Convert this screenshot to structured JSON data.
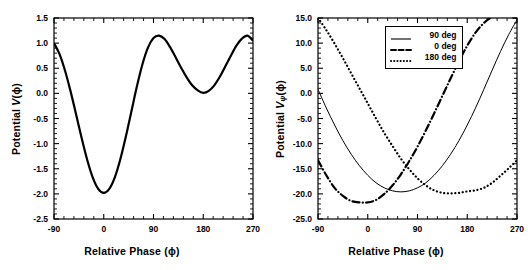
{
  "figure": {
    "background": "#ffffff",
    "ink": "#000000"
  },
  "chart_data": [
    {
      "panel": "left",
      "type": "line",
      "title": "",
      "xlabel": "Relative Phase (ϕ)",
      "ylabel": "Potential V(ϕ)",
      "ylabel_parts": {
        "prefix": "Potential ",
        "symbol": "V",
        "subscript": "",
        "suffix": "(ϕ)"
      },
      "xlim": [
        -90,
        270
      ],
      "ylim": [
        -2.5,
        1.5
      ],
      "xticks": [
        -90,
        0,
        90,
        180,
        270
      ],
      "xticklabels": [
        "-90",
        "0",
        "90",
        "180",
        "270"
      ],
      "yticks": [
        -2.5,
        -2.0,
        -1.5,
        -1.0,
        -0.5,
        0.0,
        0.5,
        1.0,
        1.5
      ],
      "yticklabels": [
        "-2.5",
        "-2.0",
        "-1.5",
        "-1.0",
        "-0.5",
        "0.0",
        "0.5",
        "1.0",
        "1.5"
      ],
      "grid": false,
      "minor_ticks_per_interval": 4,
      "legend": null,
      "series": [
        {
          "name": "V(ϕ)",
          "style": "solid",
          "linewidth": 2.2,
          "color": "#000000",
          "x": [
            -90,
            -80,
            -70,
            -60,
            -50,
            -40,
            -30,
            -20,
            -10,
            0,
            10,
            20,
            30,
            40,
            50,
            60,
            70,
            80,
            90,
            100,
            110,
            120,
            130,
            140,
            150,
            160,
            170,
            180,
            190,
            200,
            210,
            220,
            230,
            240,
            250,
            260,
            270
          ],
          "y": [
            1.0,
            0.78,
            0.45,
            0.04,
            -0.42,
            -0.89,
            -1.32,
            -1.67,
            -1.9,
            -1.98,
            -1.9,
            -1.67,
            -1.31,
            -0.86,
            -0.36,
            0.14,
            0.58,
            0.91,
            1.1,
            1.15,
            1.08,
            0.92,
            0.72,
            0.51,
            0.32,
            0.16,
            0.06,
            0.01,
            0.05,
            0.16,
            0.33,
            0.54,
            0.75,
            0.95,
            1.09,
            1.15,
            1.05
          ]
        }
      ]
    },
    {
      "panel": "right",
      "type": "line",
      "title": "",
      "xlabel": "Relative Phase (ϕ)",
      "ylabel": "Potential Vψ(ϕ)",
      "ylabel_parts": {
        "prefix": "Potential ",
        "symbol": "V",
        "subscript": "ψ",
        "suffix": "(ϕ)"
      },
      "xlim": [
        -90,
        270
      ],
      "ylim": [
        -25.0,
        15.0
      ],
      "xticks": [
        -90,
        0,
        90,
        180,
        270
      ],
      "xticklabels": [
        "-90",
        "0",
        "90",
        "180",
        "270"
      ],
      "yticks": [
        -25.0,
        -20.0,
        -15.0,
        -10.0,
        -5.0,
        0.0,
        5.0,
        10.0,
        15.0
      ],
      "yticklabels": [
        "-25.0",
        "-20.0",
        "-15.0",
        "-10.0",
        "-5.0",
        "0.0",
        "5.0",
        "10.0",
        "15.0"
      ],
      "grid": false,
      "minor_ticks_per_interval": 4,
      "legend": {
        "position": "top-center",
        "entries": [
          {
            "label": "90 deg",
            "style": "solid"
          },
          {
            "label": "0 deg",
            "style": "dashdot"
          },
          {
            "label": "180 deg",
            "style": "dotted"
          }
        ]
      },
      "series": [
        {
          "name": "90 deg",
          "style": "solid",
          "linewidth": 1.0,
          "color": "#000000",
          "x": [
            -90,
            -75,
            -60,
            -45,
            -30,
            -15,
            0,
            15,
            30,
            45,
            60,
            75,
            90,
            105,
            120,
            135,
            150,
            165,
            180,
            195,
            210,
            225,
            240,
            255,
            270
          ],
          "y": [
            0.8,
            -2.9,
            -6.3,
            -9.4,
            -12.1,
            -14.4,
            -16.3,
            -17.8,
            -18.8,
            -19.4,
            -19.6,
            -19.4,
            -18.8,
            -17.8,
            -16.3,
            -14.4,
            -12.1,
            -9.4,
            -6.3,
            -2.9,
            0.8,
            4.6,
            8.3,
            11.7,
            14.6
          ]
        },
        {
          "name": "0 deg",
          "style": "dashdot",
          "linewidth": 2.2,
          "color": "#000000",
          "x": [
            -90,
            -75,
            -60,
            -45,
            -30,
            -15,
            0,
            15,
            30,
            45,
            60,
            75,
            90,
            105,
            120,
            135,
            150,
            165,
            180,
            195,
            210,
            225,
            240,
            255,
            270
          ],
          "y": [
            -13.3,
            -16.3,
            -18.8,
            -20.4,
            -21.4,
            -21.7,
            -21.7,
            -21.2,
            -20.0,
            -18.3,
            -16.1,
            -13.5,
            -10.6,
            -7.4,
            -4.0,
            -0.5,
            3.0,
            6.4,
            9.5,
            12.1,
            14.0,
            15.2,
            15.6,
            15.4,
            15.0
          ]
        },
        {
          "name": "180 deg",
          "style": "dotted",
          "linewidth": 2.2,
          "color": "#000000",
          "x": [
            -90,
            -75,
            -60,
            -45,
            -30,
            -15,
            0,
            15,
            30,
            45,
            60,
            75,
            90,
            105,
            120,
            135,
            150,
            165,
            180,
            195,
            210,
            225,
            240,
            255,
            270
          ],
          "y": [
            15.0,
            12.6,
            9.9,
            7.0,
            4.0,
            1.0,
            -2.0,
            -5.0,
            -7.9,
            -10.5,
            -13.0,
            -15.1,
            -16.9,
            -18.3,
            -19.3,
            -19.8,
            -19.9,
            -19.8,
            -19.5,
            -19.3,
            -18.8,
            -17.8,
            -16.4,
            -14.9,
            -13.3
          ]
        }
      ]
    }
  ]
}
